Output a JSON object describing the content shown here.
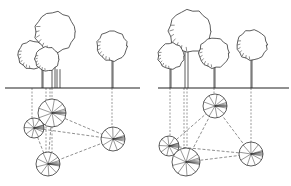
{
  "figure": {
    "panels": [
      {
        "id": "left",
        "ground": {
          "x1": 5,
          "x2": 140,
          "y": 88
        },
        "trees": [
          {
            "name": "tall-tree",
            "cx": 55,
            "cy": 32,
            "r": 20,
            "trunk_x": 52,
            "trunk_x2": 55
          },
          {
            "name": "left-small-tree",
            "cx": 32,
            "cy": 55,
            "r": 14,
            "trunk_x": 42,
            "trunk_x2": 43
          },
          {
            "name": "middle-small-tree",
            "cx": 47,
            "cy": 59,
            "r": 12,
            "trunk_x": 57,
            "trunk_x2": 60
          },
          {
            "name": "right-tree",
            "cx": 112,
            "cy": 46,
            "r": 15,
            "trunk_x": 112,
            "trunk_x2": 113
          }
        ],
        "plan_nodes": [
          {
            "name": "plan-tall-tree",
            "cx": 52,
            "cy": 113,
            "r": 14
          },
          {
            "name": "plan-left-small-tree",
            "cx": 34,
            "cy": 128,
            "r": 10
          },
          {
            "name": "plan-middle-small-tree",
            "cx": 48,
            "cy": 164,
            "r": 12
          },
          {
            "name": "plan-right-tree",
            "cx": 113,
            "cy": 139,
            "r": 12
          }
        ],
        "projections": [
          {
            "x": 32,
            "y1": 88,
            "y2": 118
          },
          {
            "x": 46,
            "y1": 88,
            "y2": 152
          },
          {
            "x": 50,
            "y1": 88,
            "y2": 99
          },
          {
            "x": 52,
            "y1": 88,
            "y2": 152
          },
          {
            "x": 112,
            "y1": 88,
            "y2": 127
          }
        ],
        "links": [
          [
            0,
            1
          ],
          [
            0,
            3
          ],
          [
            1,
            3
          ],
          [
            1,
            2
          ],
          [
            2,
            3
          ],
          [
            0,
            2
          ]
        ]
      },
      {
        "id": "right",
        "ground": {
          "x1": 158,
          "x2": 289,
          "y": 88
        },
        "trees": [
          {
            "name": "tall-tree",
            "cx": 190,
            "cy": 31,
            "r": 21,
            "trunk_x": 185,
            "trunk_x2": 188
          },
          {
            "name": "left-small-tree",
            "cx": 171,
            "cy": 56,
            "r": 13,
            "trunk_x": 170,
            "trunk_x2": 171
          },
          {
            "name": "middle-tree",
            "cx": 214,
            "cy": 53,
            "r": 15,
            "trunk_x": 214,
            "trunk_x2": 215
          },
          {
            "name": "right-tree",
            "cx": 252,
            "cy": 45,
            "r": 15,
            "trunk_x": 251,
            "trunk_x2": 252
          }
        ],
        "plan_nodes": [
          {
            "name": "plan-middle-tree",
            "cx": 215,
            "cy": 106,
            "r": 12
          },
          {
            "name": "plan-left-small-tree",
            "cx": 169,
            "cy": 146,
            "r": 10
          },
          {
            "name": "plan-tall-tree",
            "cx": 186,
            "cy": 162,
            "r": 14
          },
          {
            "name": "plan-right-tree",
            "cx": 251,
            "cy": 154,
            "r": 12
          }
        ],
        "projections": [
          {
            "x": 170,
            "y1": 88,
            "y2": 136
          },
          {
            "x": 184,
            "y1": 88,
            "y2": 148
          },
          {
            "x": 187,
            "y1": 88,
            "y2": 148
          },
          {
            "x": 214,
            "y1": 88,
            "y2": 94
          },
          {
            "x": 251,
            "y1": 88,
            "y2": 142
          }
        ],
        "links": [
          [
            0,
            1
          ],
          [
            0,
            2
          ],
          [
            0,
            3
          ],
          [
            1,
            3
          ],
          [
            2,
            3
          ]
        ]
      }
    ]
  }
}
